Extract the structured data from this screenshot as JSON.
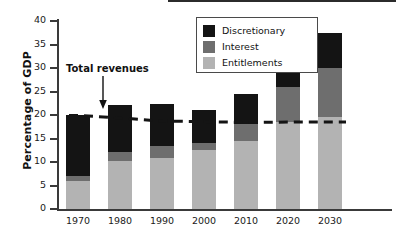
{
  "chart_data": {
    "type": "bar",
    "title": "",
    "xlabel": "",
    "ylabel": "Percentage of GDP",
    "categories": [
      "1970",
      "1980",
      "1990",
      "2000",
      "2010",
      "2020",
      "2030"
    ],
    "ylim": [
      0,
      40
    ],
    "ytick_labels": [
      "0",
      "5",
      "10",
      "15",
      "20",
      "25",
      "30",
      "35",
      "40"
    ],
    "ytick_values": [
      0,
      5,
      10,
      15,
      20,
      25,
      30,
      35,
      40
    ],
    "grid": false,
    "stacked": true,
    "legend_position": "top-center",
    "series": [
      {
        "name": "Entitlements",
        "color": "#b3b3b3",
        "values": [
          6.0,
          10.2,
          10.8,
          12.5,
          14.5,
          18.5,
          19.5
        ]
      },
      {
        "name": "Interest",
        "color": "#6e6e6e",
        "values": [
          1.0,
          2.0,
          2.6,
          1.5,
          3.5,
          7.5,
          10.5
        ]
      },
      {
        "name": "Discretionary",
        "color": "#141414",
        "values": [
          12.9,
          10.0,
          8.9,
          7.0,
          6.5,
          4.5,
          7.5
        ]
      }
    ],
    "totals": [
      19.9,
      22.2,
      22.3,
      21.0,
      24.5,
      30.5,
      37.5
    ],
    "annotation_line": {
      "name": "Total revenues",
      "style": "dashed",
      "color": "#141414",
      "values": [
        19.9,
        19.4,
        18.7,
        18.6,
        18.4,
        18.5,
        18.5
      ]
    },
    "annotations": [
      {
        "text": "Total revenues",
        "points_to": "1980"
      }
    ]
  },
  "legend": {
    "items": [
      {
        "label": "Discretionary",
        "color": "#141414"
      },
      {
        "label": "Interest",
        "color": "#6e6e6e"
      },
      {
        "label": "Entitlements",
        "color": "#b3b3b3"
      }
    ]
  },
  "axes": {
    "y_title": "Percentage of GDP"
  }
}
